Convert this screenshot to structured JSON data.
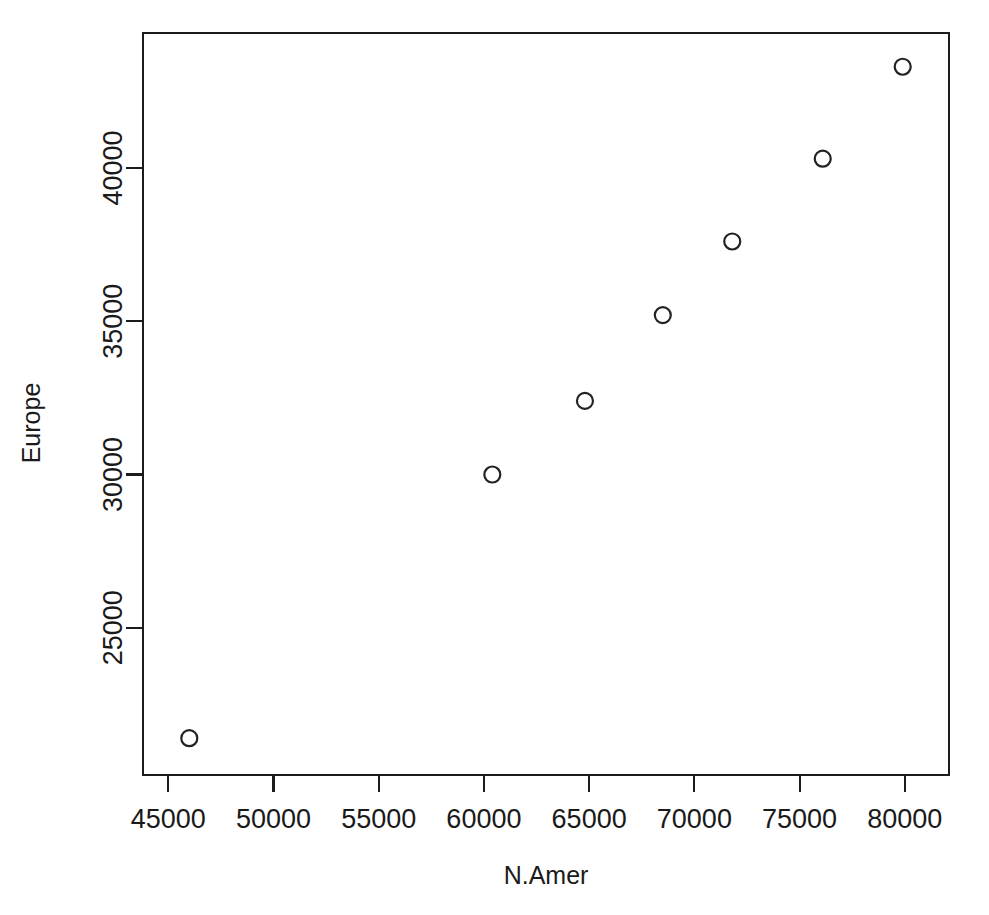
{
  "chart_data": {
    "type": "scatter",
    "title": "",
    "subtitle": "",
    "xlabel": "N.Amer",
    "ylabel": "Europe",
    "xlim": [
      43800,
      82100
    ],
    "ylim": [
      20200,
      44400
    ],
    "grid": false,
    "legend": null,
    "marker": "open-circle",
    "x_ticks": [
      45000,
      50000,
      55000,
      60000,
      65000,
      70000,
      75000,
      80000
    ],
    "x_tick_labels": [
      "45000",
      "50000",
      "55000",
      "60000",
      "65000",
      "70000",
      "75000",
      "80000"
    ],
    "y_ticks": [
      25000,
      30000,
      35000,
      40000
    ],
    "y_tick_labels": [
      "25000",
      "30000",
      "35000",
      "40000"
    ],
    "points": [
      {
        "x": 46000,
        "y": 21400
      },
      {
        "x": 60400,
        "y": 30000
      },
      {
        "x": 64800,
        "y": 32400
      },
      {
        "x": 68500,
        "y": 35200
      },
      {
        "x": 71800,
        "y": 37600
      },
      {
        "x": 76100,
        "y": 40300
      },
      {
        "x": 79900,
        "y": 43300
      }
    ],
    "x_values": [
      46000,
      60400,
      64800,
      68500,
      71800,
      76100,
      79900
    ],
    "y_values": [
      21400,
      30000,
      32400,
      35200,
      37600,
      40300,
      43300
    ],
    "point_color": "#232323",
    "axis_color": "#1c1c1c",
    "background_color": "#ffffff"
  }
}
